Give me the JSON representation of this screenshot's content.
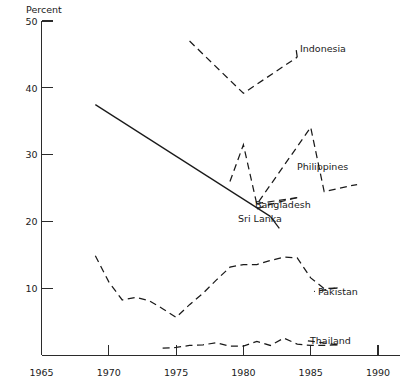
{
  "chart_data": {
    "type": "line",
    "title": "",
    "subtitle": "",
    "xlabel": "",
    "ylabel": "Percent",
    "ylim": [
      0,
      50
    ],
    "xlim": [
      1965,
      1990
    ],
    "grid": false,
    "legend_position": "inline-right-of-series",
    "yticks": [
      10,
      20,
      30,
      40,
      50
    ],
    "ytick_labels": [
      "10",
      "20",
      "30",
      "40",
      "50"
    ],
    "xticks": [
      1965,
      1970,
      1975,
      1980,
      1985,
      1990
    ],
    "xtick_labels": [
      "1965",
      "1970",
      "1975",
      "1980",
      "1985",
      "1990"
    ],
    "series": [
      {
        "name": "Indonesia",
        "style": "dashed",
        "label": "Indonesia",
        "x": [
          1976,
          1980,
          1984
        ],
        "values": [
          47.0,
          39.2,
          44.6
        ]
      },
      {
        "name": "Sri Lanka",
        "style": "solid",
        "label": "Sri Lanka",
        "x": [
          1969,
          1982
        ],
        "values": [
          37.5,
          20.8
        ]
      },
      {
        "name": "Philippines",
        "style": "dashed",
        "label": "Philippines",
        "x": [
          1979,
          1980,
          1981,
          1985,
          1986,
          1988
        ],
        "values": [
          26.0,
          31.5,
          22.6,
          34.1,
          24.5,
          25.4
        ]
      },
      {
        "name": "Bangladesh",
        "style": "dashed",
        "label": "Bangladesh",
        "x": [
          1981,
          1982,
          1984
        ],
        "values": [
          21.9,
          22.6,
          23.6
        ]
      },
      {
        "name": "Pakistan",
        "style": "dashed",
        "label": "Pakistan",
        "x": [
          1969,
          1970,
          1971,
          1972,
          1973,
          1974,
          1975,
          1976,
          1977,
          1978,
          1979,
          1980,
          1981,
          1982,
          1983,
          1984,
          1985,
          1986,
          1987
        ],
        "values": [
          14.9,
          11.0,
          8.3,
          8.7,
          8.2,
          7.0,
          5.7,
          7.6,
          9.3,
          11.3,
          13.2,
          13.6,
          13.6,
          14.2,
          14.7,
          14.6,
          11.6,
          10.0,
          10.1
        ]
      },
      {
        "name": "Thailand",
        "style": "dashed",
        "label": "Thailand",
        "x": [
          1974,
          1975,
          1976,
          1977,
          1978,
          1979,
          1980,
          1981,
          1982,
          1983,
          1984,
          1985,
          1986,
          1987
        ],
        "values": [
          1.1,
          1.2,
          1.5,
          1.6,
          1.9,
          1.4,
          1.4,
          2.1,
          1.5,
          2.6,
          1.7,
          1.5,
          1.5,
          1.6
        ]
      }
    ]
  },
  "axis": {
    "y_unit_label": "Percent"
  },
  "colors": {
    "ink": "#1a1a1a",
    "axis": "#2b2b2b",
    "background": "#ffffff"
  }
}
